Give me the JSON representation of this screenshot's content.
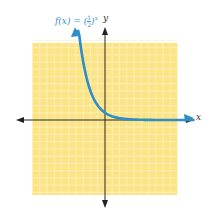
{
  "chart_data": {
    "type": "line",
    "title": "",
    "function_label": {
      "lhs": "f(x) = (",
      "num": "1",
      "den": "2",
      "rhs": ")",
      "exp": "x"
    },
    "xlabel": "x",
    "ylabel": "y",
    "series": [
      {
        "name": "f(x) = (1/2)^x",
        "function": "(1/2)^x",
        "color": "#2e8fc8",
        "x": [
          -3.5,
          -3,
          -2,
          -1,
          0,
          1,
          2,
          3,
          4,
          5,
          6,
          7,
          8,
          9,
          10
        ],
        "values": [
          11.3,
          8,
          4,
          2,
          1,
          0.5,
          0.25,
          0.125,
          0.0625,
          0.031,
          0.016,
          0.008,
          0.004,
          0.002,
          0.001
        ]
      }
    ],
    "xlim": [
      -10,
      10
    ],
    "ylim": [
      -10,
      11
    ],
    "grid": true,
    "grid_color": "#fdf3c0",
    "background_color": "#fce486"
  }
}
